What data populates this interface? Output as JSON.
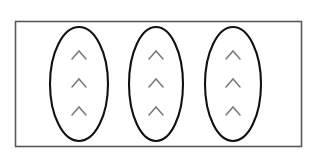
{
  "figure": {
    "title": "Three ellipses each containing three chevron marks",
    "background_color": "#ffffff",
    "canvas": {
      "width": 322,
      "height": 162
    },
    "frame": {
      "name": "outer-rectangle",
      "x": 15.5,
      "y": 21.5,
      "width": 286,
      "height": 125,
      "stroke_color": "#5a5a5a",
      "stroke_width": 1.6,
      "fill": "none"
    },
    "ellipse_style": {
      "stroke_color": "#111111",
      "stroke_width": 2.1,
      "fill": "none",
      "rx": 28,
      "ry": 56
    },
    "mark_style": {
      "glyph": "^",
      "semantic_name": "chevron-mark",
      "stroke_color": "#7a7a7a",
      "stroke_width": 1.5,
      "half_width": 7,
      "height": 8
    },
    "ellipses": [
      {
        "id": "ellipse-1",
        "label": "Left ellipse",
        "cx": 79,
        "cy": 84,
        "rx": 29,
        "ry": 57,
        "marks": [
          {
            "id": "mark-1-1",
            "cx": 79,
            "cy": 55
          },
          {
            "id": "mark-1-2",
            "cx": 79,
            "cy": 83
          },
          {
            "id": "mark-1-3",
            "cx": 79,
            "cy": 111
          }
        ]
      },
      {
        "id": "ellipse-2",
        "label": "Middle ellipse",
        "cx": 156,
        "cy": 84,
        "rx": 27,
        "ry": 57,
        "marks": [
          {
            "id": "mark-2-1",
            "cx": 156,
            "cy": 55
          },
          {
            "id": "mark-2-2",
            "cx": 156,
            "cy": 83
          },
          {
            "id": "mark-2-3",
            "cx": 156,
            "cy": 111
          }
        ]
      },
      {
        "id": "ellipse-3",
        "label": "Right ellipse",
        "cx": 233,
        "cy": 84,
        "rx": 28,
        "ry": 57,
        "marks": [
          {
            "id": "mark-3-1",
            "cx": 233,
            "cy": 55
          },
          {
            "id": "mark-3-2",
            "cx": 233,
            "cy": 83
          },
          {
            "id": "mark-3-3",
            "cx": 233,
            "cy": 111
          }
        ]
      }
    ]
  }
}
